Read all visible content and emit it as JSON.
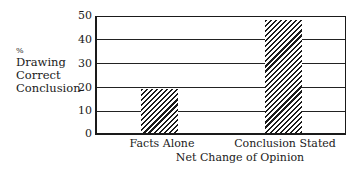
{
  "chart_data": {
    "type": "bar",
    "title": "",
    "xlabel": "Net Change of Opinion",
    "ylabel": "% Drawing Correct Conclusion",
    "ylabel_lines": [
      "%",
      "Drawing",
      "Correct",
      "Conclusion"
    ],
    "categories": [
      "Facts Alone",
      "Conclusion Stated"
    ],
    "values": [
      19,
      49
    ],
    "ylim": [
      0,
      50
    ],
    "yticks": [
      0,
      10,
      20,
      30,
      40,
      50
    ],
    "grid": true,
    "legend": null,
    "bar_fill": "diagonal-hatch"
  }
}
